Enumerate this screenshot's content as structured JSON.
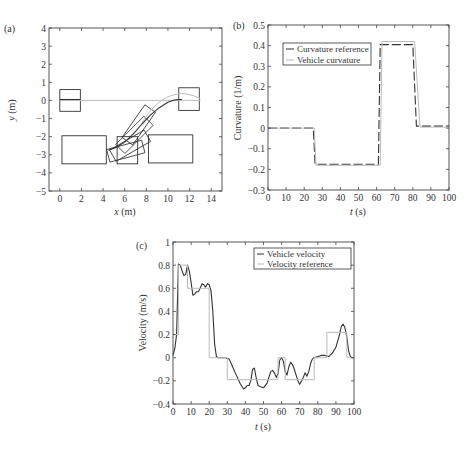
{
  "chart_data": [
    {
      "id": "a",
      "panel_label": "(a)",
      "type": "line",
      "title": "",
      "xlabel_var": "x",
      "xlabel_unit": " (m)",
      "ylabel_var": "y",
      "ylabel_unit": " (m)",
      "xlim": [
        -1,
        15
      ],
      "ylim": [
        -5,
        4
      ],
      "xticks": [
        0,
        2,
        4,
        6,
        8,
        10,
        12,
        14
      ],
      "yticks": [
        -5,
        -4,
        -3,
        -2,
        -1,
        0,
        1,
        2,
        3,
        4
      ],
      "grid": false,
      "frame_px": [
        49,
        28,
        222,
        191
      ],
      "rectangles": [
        {
          "name": "start-slot",
          "x": [
            0,
            1.9
          ],
          "y": [
            -0.6,
            0.6
          ]
        },
        {
          "name": "goal-slot",
          "x": [
            11,
            12.9
          ],
          "y": [
            -0.55,
            0.7
          ]
        },
        {
          "name": "obstacle-left",
          "x": [
            0.2,
            4.3
          ],
          "y": [
            -3.5,
            -1.95
          ]
        },
        {
          "name": "obstacle-middle",
          "x": [
            5.3,
            7.2
          ],
          "y": [
            -3.5,
            -2.0
          ]
        },
        {
          "name": "obstacle-right",
          "x": [
            8.2,
            12.3
          ],
          "y": [
            -3.45,
            -1.9
          ]
        }
      ],
      "rotated_boxes": [
        {
          "cx": 7.3,
          "cy": -1.35,
          "w": 1.2,
          "h": 2.2,
          "angle": 35
        },
        {
          "cx": 6.9,
          "cy": -1.9,
          "w": 1.2,
          "h": 2.2,
          "angle": 45
        },
        {
          "cx": 6.5,
          "cy": -2.5,
          "w": 1.2,
          "h": 2.2,
          "angle": 60
        },
        {
          "cx": 6.1,
          "cy": -2.8,
          "w": 1.2,
          "h": 2.0,
          "angle": 75
        }
      ],
      "series": [
        {
          "name": "Reference path",
          "color": "#bbbbbb",
          "x": [
            0,
            2,
            4,
            6,
            8,
            9,
            10,
            11,
            11.5,
            12,
            12.5,
            13
          ],
          "y": [
            0,
            0,
            0,
            0,
            0,
            0,
            0,
            0,
            0,
            0,
            0,
            0
          ]
        },
        {
          "name": "Reference curve",
          "color": "#bbbbbb",
          "x": [
            7.6,
            8.2,
            8.8,
            9.4,
            10,
            10.6,
            11.2,
            11.8,
            12.4,
            13
          ],
          "y": [
            -1.2,
            -0.7,
            -0.3,
            0.0,
            0.2,
            0.32,
            0.38,
            0.35,
            0.25,
            0.1
          ]
        },
        {
          "name": "Vehicle path",
          "color": "#333333",
          "x": [
            4.5,
            5.2,
            6.0,
            6.8,
            7.6,
            8.4,
            9.2,
            10.0,
            10.6,
            11.0,
            11.3
          ],
          "y": [
            -2.75,
            -2.6,
            -2.3,
            -1.85,
            -1.3,
            -0.8,
            -0.4,
            -0.1,
            0.02,
            0.05,
            0.05
          ]
        },
        {
          "name": "Start line",
          "color": "#333333",
          "x": [
            0,
            1.9
          ],
          "y": [
            0.05,
            0.05
          ]
        }
      ]
    },
    {
      "id": "b",
      "panel_label": "(b)",
      "type": "line",
      "title": "",
      "xlabel_var": "t",
      "xlabel_unit": " (s)",
      "ylabel": "Curvature (1/m)",
      "xlim": [
        0,
        100
      ],
      "ylim": [
        -0.3,
        0.5
      ],
      "xticks": [
        0,
        10,
        20,
        30,
        40,
        50,
        60,
        70,
        80,
        90,
        100
      ],
      "yticks": [
        -0.3,
        -0.2,
        -0.1,
        0,
        0.1,
        0.2,
        0.3,
        0.4,
        0.5
      ],
      "ytick_labels": [
        "−0.3",
        "−0.2",
        "−0.1",
        "0",
        "0.1",
        "0.2",
        "0.3",
        "0.4",
        "0.5"
      ],
      "grid": false,
      "frame_px": [
        268,
        25,
        449,
        190
      ],
      "legend": {
        "position": "upper-left",
        "entries": [
          "Curvature reference",
          "Vehicle curvature"
        ]
      },
      "series": [
        {
          "name": "Curvature reference",
          "color": "#333333",
          "dash": "9,3",
          "x": [
            0,
            25,
            26,
            61,
            62,
            80,
            82,
            100
          ],
          "y": [
            0,
            0,
            -0.175,
            -0.175,
            0.405,
            0.405,
            0.01,
            0.01
          ]
        },
        {
          "name": "Vehicle curvature",
          "color": "#bbbbbb",
          "dash": "",
          "x": [
            0,
            25.5,
            26.5,
            62,
            63,
            81,
            84,
            100
          ],
          "y": [
            0,
            0,
            -0.18,
            -0.18,
            0.42,
            0.42,
            0.005,
            0.005
          ]
        }
      ]
    },
    {
      "id": "c",
      "panel_label": "(c)",
      "type": "line",
      "title": "",
      "xlabel_var": "t",
      "xlabel_unit": " (s)",
      "ylabel": "Velocity (m/s)",
      "xlim": [
        0,
        100
      ],
      "ylim": [
        -0.4,
        1
      ],
      "xticks": [
        0,
        10,
        20,
        30,
        40,
        50,
        60,
        70,
        80,
        90,
        100
      ],
      "yticks": [
        -0.4,
        -0.2,
        0,
        0.2,
        0.4,
        0.6,
        0.8,
        1
      ],
      "ytick_labels": [
        "−0.4",
        "−0.2",
        "0",
        "0.2",
        "0.4",
        "0.6",
        "0.8",
        "1"
      ],
      "grid": false,
      "frame_px": [
        173,
        242,
        354,
        404
      ],
      "legend": {
        "position": "upper-right",
        "entries": [
          "Vehicle velocity",
          "Velocity reference"
        ]
      },
      "series": [
        {
          "name": "Vehicle velocity",
          "color": "#333333",
          "x": [
            0,
            1,
            2,
            3,
            4,
            5,
            6,
            7,
            8,
            9,
            10,
            11,
            12,
            13,
            14,
            15,
            16,
            17,
            18,
            19,
            20,
            21,
            22,
            23,
            24,
            25,
            27,
            29,
            31,
            33,
            35,
            37,
            39,
            40,
            41,
            42,
            43,
            44,
            45,
            46,
            47,
            48,
            50,
            52,
            53,
            54,
            55,
            56,
            57,
            58,
            59,
            60,
            61,
            62,
            63,
            64,
            65,
            66,
            67,
            68,
            69,
            70,
            71,
            72,
            73,
            74,
            75,
            76,
            77,
            78,
            80,
            82,
            84,
            86,
            88,
            90,
            92,
            93,
            94,
            95,
            96,
            97,
            98,
            99,
            100
          ],
          "y": [
            0.02,
            0.08,
            0.2,
            0.81,
            0.8,
            0.75,
            0.71,
            0.72,
            0.8,
            0.75,
            0.65,
            0.54,
            0.55,
            0.57,
            0.57,
            0.6,
            0.64,
            0.63,
            0.61,
            0.64,
            0.63,
            0.58,
            0.4,
            0.12,
            0.01,
            0.0,
            0.0,
            0.0,
            -0.01,
            -0.08,
            -0.15,
            -0.22,
            -0.27,
            -0.26,
            -0.24,
            -0.24,
            -0.2,
            -0.1,
            -0.09,
            -0.18,
            -0.24,
            -0.25,
            -0.26,
            -0.22,
            -0.17,
            -0.12,
            -0.11,
            -0.13,
            -0.17,
            -0.14,
            -0.02,
            0.0,
            -0.03,
            -0.12,
            -0.15,
            -0.08,
            -0.04,
            -0.06,
            -0.1,
            -0.15,
            -0.2,
            -0.23,
            -0.2,
            -0.17,
            -0.13,
            -0.16,
            -0.12,
            -0.05,
            -0.01,
            0.0,
            0.01,
            0.02,
            0.02,
            0.01,
            0.04,
            0.09,
            0.2,
            0.27,
            0.29,
            0.26,
            0.18,
            0.06,
            0.01,
            0.0,
            0.0
          ]
        },
        {
          "name": "Velocity reference",
          "color": "#bbbbbb",
          "x": [
            0,
            3,
            3,
            8,
            8,
            20,
            20,
            30,
            30,
            58,
            58,
            62,
            62,
            78,
            78,
            85,
            85,
            96,
            96,
            100
          ],
          "y": [
            0.2,
            0.2,
            0.8,
            0.8,
            0.6,
            0.6,
            0.0,
            0.0,
            -0.19,
            -0.19,
            0.0,
            0.0,
            -0.19,
            -0.19,
            0.0,
            0.0,
            0.22,
            0.22,
            0.0,
            0.0
          ]
        }
      ]
    }
  ]
}
